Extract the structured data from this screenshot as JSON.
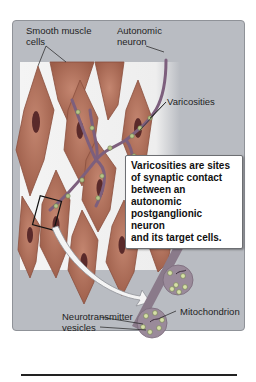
{
  "labels": {
    "smooth_muscle": [
      "Smooth muscle",
      "cells"
    ],
    "autonomic_neuron": [
      "Autonomic",
      "neuron"
    ],
    "varicosities": "Varicosities",
    "neurotransmitter_vesicles": [
      "Neurotransmitter",
      "vesicles"
    ],
    "mitochondrion": "Mitochondrion"
  },
  "callout": {
    "lines": [
      "Varicosities are sites",
      "of synaptic contact",
      "between an autonomic",
      "postganglionic neuron",
      "and its target cells."
    ]
  },
  "colors": {
    "panel": "#b9bcc2",
    "tissue_bg": "#f1f1f1",
    "muscle_cell": "#b0705a",
    "muscle_cell_edge": "#8a4f3e",
    "nucleus": "#5a2a2a",
    "neuron": "#7d5f7d",
    "varicosity": "#b7c58a",
    "vesicle": "#d7e0a8"
  }
}
